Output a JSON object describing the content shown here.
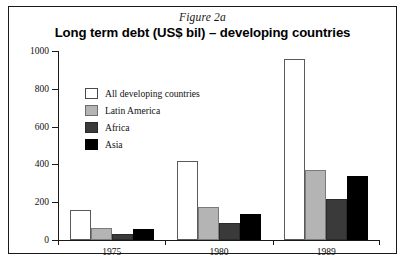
{
  "figure": {
    "caption": "Figure 2a",
    "title": "Long term debt (US$ bil) – developing countries"
  },
  "legend": {
    "entries": [
      {
        "label": "All developing countries",
        "color": "#ffffff",
        "swatch": "s0"
      },
      {
        "label": "Latin America",
        "color": "#b4b4b4",
        "swatch": "s1"
      },
      {
        "label": "Africa",
        "color": "#3a3a3a",
        "swatch": "s2"
      },
      {
        "label": "Asia",
        "color": "#000000",
        "swatch": "s3"
      }
    ]
  },
  "axes": {
    "y_ticks": [
      "0",
      "200",
      "400",
      "600",
      "800",
      "1000"
    ],
    "x_ticks": [
      "1975",
      "1980",
      "1989"
    ]
  },
  "chart_data": {
    "type": "bar",
    "title": "Long term debt (US$ bil) – developing countries",
    "subtitle": "Figure 2a",
    "xlabel": "",
    "ylabel": "",
    "ylim": [
      0,
      1000
    ],
    "ytick_values": [
      0,
      200,
      400,
      600,
      800,
      1000
    ],
    "grid": false,
    "legend_position": "inside-upper-left",
    "categories": [
      "1975",
      "1980",
      "1989"
    ],
    "series": [
      {
        "name": "All developing countries",
        "color": "#ffffff",
        "values": [
          160,
          415,
          960
        ]
      },
      {
        "name": "Latin America",
        "color": "#b4b4b4",
        "values": [
          65,
          175,
          370
        ]
      },
      {
        "name": "Africa",
        "color": "#3a3a3a",
        "values": [
          30,
          90,
          215
        ]
      },
      {
        "name": "Asia",
        "color": "#000000",
        "values": [
          55,
          135,
          340
        ]
      }
    ],
    "units": "US$ billion"
  }
}
